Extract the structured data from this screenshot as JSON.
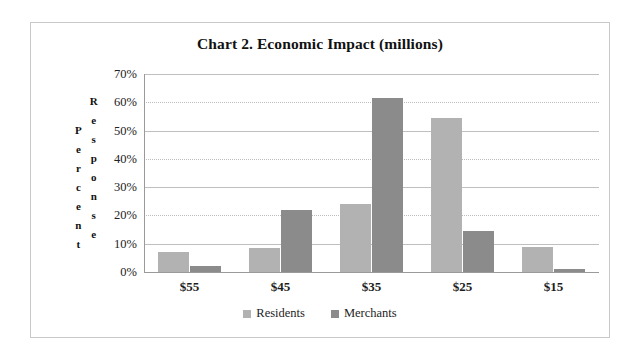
{
  "frame": {
    "border_color": "#c9c9c9",
    "background": "#ffffff"
  },
  "chart_data": {
    "type": "bar",
    "title": "Chart 2.  Economic Impact (millions)",
    "xlabel": "",
    "ylabel": "Percent Response",
    "ylabel_stacked": [
      "Percent",
      "Response"
    ],
    "categories": [
      "$55",
      "$45",
      "$35",
      "$25",
      "$15"
    ],
    "series": [
      {
        "name": "Residents",
        "color": "#b2b2b2",
        "values": [
          7,
          8.5,
          24,
          54.5,
          9
        ]
      },
      {
        "name": "Merchants",
        "color": "#8b8b8b",
        "values": [
          2,
          22,
          61.5,
          14.5,
          1
        ]
      }
    ],
    "ylim": [
      0,
      70
    ],
    "ytick_values": [
      70,
      60,
      50,
      40,
      30,
      20,
      10,
      0
    ],
    "ytick_labels": [
      "70%",
      "60%",
      "50%",
      "40%",
      "30%",
      "20%",
      "10%",
      "0%"
    ],
    "grid": true,
    "grid_style_alternating": [
      "solid",
      "dotted"
    ],
    "legend_position": "bottom",
    "legend_entries": [
      "Residents",
      "Merchants"
    ]
  }
}
